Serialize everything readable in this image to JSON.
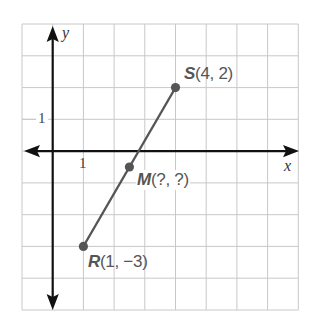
{
  "graph": {
    "x_axis_label": "x",
    "y_axis_label": "y",
    "x_tick_label": "1",
    "y_tick_label": "1",
    "grid": {
      "x_min": -1,
      "x_max": 8,
      "y_min": -5,
      "y_max": 4
    },
    "points": [
      {
        "name": "S",
        "coords": "(4, 2)",
        "x": 4,
        "y": 2
      },
      {
        "name": "M",
        "coords": "(?, ?)",
        "x": 2.5,
        "y": -0.5
      },
      {
        "name": "R",
        "coords": "(1, −3)",
        "x": 1,
        "y": -3
      }
    ],
    "segment": {
      "from": "R",
      "to": "S",
      "color": "#555555"
    }
  }
}
